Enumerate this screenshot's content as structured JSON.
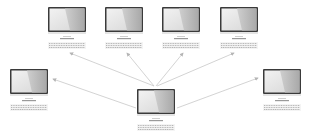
{
  "diagram": {
    "type": "network-topology",
    "colors": {
      "background": "#ffffff",
      "arrow": "#c8c8c8",
      "monitor_frame": "#3a3a3a",
      "screen_light": "#eeeeee",
      "screen_dark": "#bdbdbd",
      "keyboard": "#9a9a9a"
    },
    "hub": {
      "id": "center-computer",
      "x": 137,
      "y": 89
    },
    "nodes": [
      {
        "id": "computer-top-1",
        "x": 48,
        "y": 7
      },
      {
        "id": "computer-top-2",
        "x": 105,
        "y": 7
      },
      {
        "id": "computer-top-3",
        "x": 162,
        "y": 7
      },
      {
        "id": "computer-top-4",
        "x": 220,
        "y": 7
      },
      {
        "id": "computer-left",
        "x": 10,
        "y": 69
      },
      {
        "id": "computer-right",
        "x": 263,
        "y": 69
      }
    ],
    "arrows": [
      {
        "from": "center-computer",
        "to": "computer-top-1",
        "x1": 154,
        "y1": 86,
        "x2": 70,
        "y2": 53
      },
      {
        "from": "center-computer",
        "to": "computer-top-2",
        "x1": 154,
        "y1": 86,
        "x2": 127,
        "y2": 53
      },
      {
        "from": "center-computer",
        "to": "computer-top-3",
        "x1": 156,
        "y1": 86,
        "x2": 183,
        "y2": 53
      },
      {
        "from": "center-computer",
        "to": "computer-top-4",
        "x1": 157,
        "y1": 86,
        "x2": 234,
        "y2": 53
      },
      {
        "from": "center-computer",
        "to": "computer-left",
        "x1": 136,
        "y1": 108,
        "x2": 53,
        "y2": 79
      },
      {
        "from": "center-computer",
        "to": "computer-right",
        "x1": 177,
        "y1": 108,
        "x2": 258,
        "y2": 78
      }
    ]
  }
}
